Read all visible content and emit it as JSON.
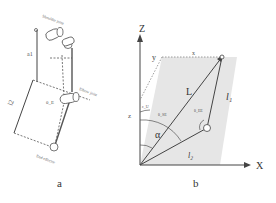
{
  "panel_a": {
    "caption": "a",
    "labels": {
      "shoulder": "Shoulder joint",
      "elbow": "Elbow joint",
      "end": "End effector",
      "upper_arm": "a1",
      "forearm": "l2",
      "angle": "θ_E"
    }
  },
  "panel_b": {
    "caption": "b",
    "axes": {
      "z": "Z",
      "x": "X",
      "y": "y",
      "x_small": "x",
      "z_small": "z"
    },
    "labels": {
      "L": "L",
      "l1": "l₁",
      "l2": "l₂",
      "alpha": "α",
      "theta_se": "θ_SE",
      "theta_ee": "θ_EE",
      "theta_u": "ε_U"
    },
    "colors": {
      "plane_fill": "#e6e6e6",
      "line": "#444444"
    }
  }
}
